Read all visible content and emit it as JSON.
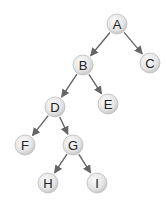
{
  "diagram": {
    "type": "binary-tree",
    "node_style": {
      "radius": 10,
      "fill_light": "#f4f4f4",
      "fill_dark": "#cfcfcf",
      "stroke": "#bdbdbd",
      "text_color": "#222222"
    },
    "edge_color": "#666666",
    "nodes": [
      {
        "id": "A",
        "label": "A",
        "x": 117,
        "y": 24
      },
      {
        "id": "B",
        "label": "B",
        "x": 83,
        "y": 65
      },
      {
        "id": "C",
        "label": "C",
        "x": 150,
        "y": 63
      },
      {
        "id": "D",
        "label": "D",
        "x": 55,
        "y": 107
      },
      {
        "id": "E",
        "label": "E",
        "x": 108,
        "y": 104
      },
      {
        "id": "F",
        "label": "F",
        "x": 25,
        "y": 145
      },
      {
        "id": "G",
        "label": "G",
        "x": 73,
        "y": 145
      },
      {
        "id": "H",
        "label": "H",
        "x": 48,
        "y": 183
      },
      {
        "id": "I",
        "label": "I",
        "x": 97,
        "y": 183
      }
    ],
    "edges": [
      {
        "from": "A",
        "to": "B"
      },
      {
        "from": "A",
        "to": "C"
      },
      {
        "from": "B",
        "to": "D"
      },
      {
        "from": "B",
        "to": "E"
      },
      {
        "from": "D",
        "to": "F"
      },
      {
        "from": "D",
        "to": "G"
      },
      {
        "from": "G",
        "to": "H"
      },
      {
        "from": "G",
        "to": "I"
      }
    ]
  }
}
